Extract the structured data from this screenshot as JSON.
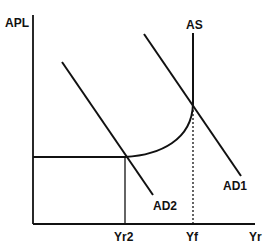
{
  "diagram": {
    "type": "AD-AS model",
    "axes": {
      "y_label": "APL",
      "x_label": "Yr"
    },
    "curves": {
      "as_label": "AS",
      "ad1_label": "AD1",
      "ad2_label": "AD2"
    },
    "x_ticks": {
      "yr2": "Yr2",
      "yf": "Yf"
    },
    "colors": {
      "line": "#111111",
      "background": "#ffffff"
    }
  }
}
